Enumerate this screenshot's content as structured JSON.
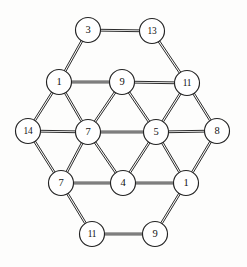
{
  "figure": {
    "background_color": "#fdfdfc",
    "ink_color": "#232323",
    "node_fill": "#ffffff",
    "width": 247,
    "height": 267,
    "node_radius": 12.5,
    "edge_style": "double-line",
    "edge_gap": 1.8
  },
  "graph_data": {
    "type": "node-link-diagram",
    "node_count": 14,
    "edge_count": 31,
    "nodes": [
      {
        "id": "n0",
        "label": "3",
        "x": 88,
        "y": 30,
        "row": 0,
        "col": 0
      },
      {
        "id": "n1",
        "label": "13",
        "x": 152,
        "y": 31,
        "row": 0,
        "col": 1
      },
      {
        "id": "n2",
        "label": "1",
        "x": 59,
        "y": 82,
        "row": 1,
        "col": 0
      },
      {
        "id": "n3",
        "label": "9",
        "x": 122,
        "y": 82,
        "row": 1,
        "col": 1
      },
      {
        "id": "n4",
        "label": "11",
        "x": 187,
        "y": 83,
        "row": 1,
        "col": 2
      },
      {
        "id": "n5",
        "label": "14",
        "x": 28,
        "y": 131,
        "row": 2,
        "col": 0
      },
      {
        "id": "n6",
        "label": "7",
        "x": 88,
        "y": 132,
        "row": 2,
        "col": 1
      },
      {
        "id": "n7",
        "label": "5",
        "x": 156,
        "y": 132,
        "row": 2,
        "col": 2
      },
      {
        "id": "n8",
        "label": "8",
        "x": 217,
        "y": 131,
        "row": 2,
        "col": 3
      },
      {
        "id": "n9",
        "label": "7",
        "x": 61,
        "y": 183,
        "row": 3,
        "col": 0
      },
      {
        "id": "n10",
        "label": "4",
        "x": 123,
        "y": 183,
        "row": 3,
        "col": 1
      },
      {
        "id": "n11",
        "label": "1",
        "x": 186,
        "y": 183,
        "row": 3,
        "col": 2
      },
      {
        "id": "n12",
        "label": "11",
        "x": 92,
        "y": 234,
        "row": 4,
        "col": 0
      },
      {
        "id": "n13",
        "label": "9",
        "x": 155,
        "y": 234,
        "row": 4,
        "col": 1
      }
    ],
    "edges": [
      {
        "source": "n0",
        "target": "n1"
      },
      {
        "source": "n0",
        "target": "n2"
      },
      {
        "source": "n1",
        "target": "n4"
      },
      {
        "source": "n2",
        "target": "n3"
      },
      {
        "source": "n3",
        "target": "n4"
      },
      {
        "source": "n2",
        "target": "n5"
      },
      {
        "source": "n2",
        "target": "n6"
      },
      {
        "source": "n3",
        "target": "n6"
      },
      {
        "source": "n3",
        "target": "n7"
      },
      {
        "source": "n4",
        "target": "n7"
      },
      {
        "source": "n4",
        "target": "n8"
      },
      {
        "source": "n5",
        "target": "n6"
      },
      {
        "source": "n6",
        "target": "n7"
      },
      {
        "source": "n7",
        "target": "n8"
      },
      {
        "source": "n5",
        "target": "n9"
      },
      {
        "source": "n6",
        "target": "n9"
      },
      {
        "source": "n6",
        "target": "n10"
      },
      {
        "source": "n7",
        "target": "n10"
      },
      {
        "source": "n7",
        "target": "n11"
      },
      {
        "source": "n8",
        "target": "n11"
      },
      {
        "source": "n9",
        "target": "n10"
      },
      {
        "source": "n10",
        "target": "n11"
      },
      {
        "source": "n9",
        "target": "n12"
      },
      {
        "source": "n11",
        "target": "n13"
      },
      {
        "source": "n12",
        "target": "n13"
      }
    ]
  }
}
